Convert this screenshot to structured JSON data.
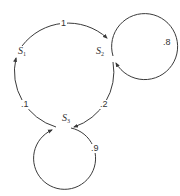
{
  "diagram": {
    "type": "markov-chain-state-transition",
    "states": [
      {
        "id": "S1",
        "label": "S",
        "sub": "1"
      },
      {
        "id": "S2",
        "label": "S",
        "sub": "2"
      },
      {
        "id": "S3",
        "label": "S",
        "sub": "3"
      }
    ],
    "transitions": [
      {
        "from": "S1",
        "to": "S2",
        "label": "1"
      },
      {
        "from": "S2",
        "to": "S3",
        "label": ".2"
      },
      {
        "from": "S3",
        "to": "S1",
        "label": ".1"
      },
      {
        "from": "S2",
        "to": "S2",
        "label": ".8"
      },
      {
        "from": "S3",
        "to": "S3",
        "label": ".9"
      }
    ],
    "colors": {
      "stroke": "#3a3a3a",
      "text": "#333333",
      "background": "#ffffff"
    }
  }
}
